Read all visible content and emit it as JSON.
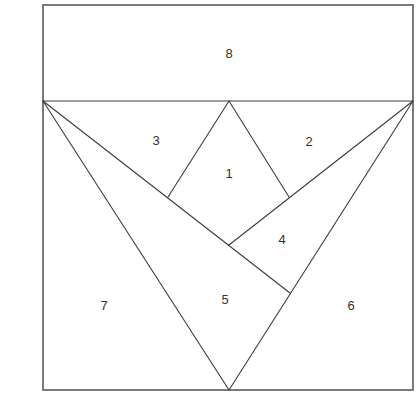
{
  "diagram": {
    "type": "paper-pieced quilt block pattern",
    "colors": {
      "background": "#ffffff",
      "outline": "#5a5a5a",
      "seam_lines": "#3c3c3c",
      "label_text": "#333333"
    },
    "outer_square": {
      "x1": 43,
      "y1": 5,
      "x2": 413,
      "y2": 390
    },
    "points": {
      "band_left": [
        43,
        101
      ],
      "band_right": [
        413,
        101
      ],
      "top_apex": [
        229,
        101
      ],
      "kite_left": [
        168,
        197
      ],
      "kite_right": [
        289,
        197
      ],
      "kite_bottom": [
        229,
        245
      ],
      "cross_point": [
        290,
        293
      ],
      "bottom_apex": [
        229,
        390
      ]
    },
    "segments": [
      {
        "name": "band-divider",
        "from": "band_left",
        "to": "band_right"
      },
      {
        "name": "left-v-edge",
        "from": "band_left",
        "to": "bottom_apex"
      },
      {
        "name": "right-v-edge",
        "from": "band_right",
        "to": "bottom_apex"
      },
      {
        "name": "left-diagonal",
        "from": "band_left",
        "to": "cross_point"
      },
      {
        "name": "right-diagonal",
        "from": "band_right",
        "to": "kite_bottom"
      },
      {
        "name": "kite-left-upper",
        "from": "top_apex",
        "to": "kite_left"
      },
      {
        "name": "kite-right-upper",
        "from": "top_apex",
        "to": "kite_right"
      }
    ],
    "pieces": [
      {
        "id": "piece-1",
        "label": "1",
        "x": 229,
        "y": 173
      },
      {
        "id": "piece-2",
        "label": "2",
        "x": 309,
        "y": 141
      },
      {
        "id": "piece-3",
        "label": "3",
        "x": 156,
        "y": 140
      },
      {
        "id": "piece-4",
        "label": "4",
        "x": 282,
        "y": 239
      },
      {
        "id": "piece-5",
        "label": "5",
        "x": 225,
        "y": 299
      },
      {
        "id": "piece-6",
        "label": "6",
        "x": 351,
        "y": 305
      },
      {
        "id": "piece-7",
        "label": "7",
        "x": 104,
        "y": 305
      },
      {
        "id": "piece-8",
        "label": "8",
        "x": 229,
        "y": 53
      }
    ]
  }
}
